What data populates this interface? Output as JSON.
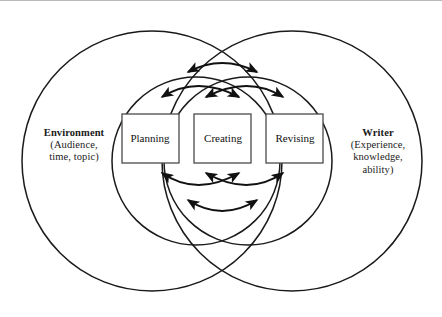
{
  "figure": {
    "type": "venn-with-process-cycle",
    "background_color": "#ffffff",
    "stroke_color": "#1a1a1a"
  },
  "contexts": {
    "left": {
      "name": "Environment",
      "detail_lines": [
        "(Audience,",
        "time, topic)"
      ]
    },
    "right": {
      "name": "Writer",
      "detail_lines": [
        "(Experience,",
        "knowledge,",
        "ability)"
      ]
    }
  },
  "stages": [
    {
      "id": "planning",
      "label": "Planning"
    },
    {
      "id": "creating",
      "label": "Creating"
    },
    {
      "id": "revising",
      "label": "Revising"
    }
  ],
  "connections": [
    {
      "from": "planning",
      "to": "creating",
      "position": "above",
      "bidirectional": true
    },
    {
      "from": "creating",
      "to": "revising",
      "position": "above",
      "bidirectional": true
    },
    {
      "from": "planning",
      "to": "revising",
      "position": "above-outer",
      "bidirectional": true
    },
    {
      "from": "planning",
      "to": "creating",
      "position": "below",
      "bidirectional": true
    },
    {
      "from": "creating",
      "to": "revising",
      "position": "below",
      "bidirectional": true
    },
    {
      "from": "planning",
      "to": "revising",
      "position": "below-outer",
      "bidirectional": true
    }
  ],
  "circles": [
    {
      "id": "environment-outer",
      "cx": 152,
      "cy": 160,
      "r": 130
    },
    {
      "id": "writer-outer",
      "cx": 292,
      "cy": 160,
      "r": 130
    },
    {
      "id": "environment-inner",
      "cx": 196,
      "cy": 160,
      "r": 84
    },
    {
      "id": "writer-inner",
      "cx": 248,
      "cy": 160,
      "r": 84
    }
  ]
}
